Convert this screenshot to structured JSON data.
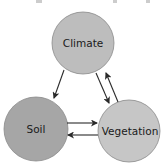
{
  "diagram": {
    "type": "cycle",
    "nodes": [
      {
        "id": "climate",
        "label": "Climate",
        "cx": 83,
        "cy": 43,
        "r": 31,
        "fill": "#bdbdbd"
      },
      {
        "id": "soil",
        "label": "Soil",
        "cx": 36,
        "cy": 129,
        "r": 32,
        "fill": "#a6a6a6"
      },
      {
        "id": "vegetation",
        "label": "Vegetation",
        "cx": 129,
        "cy": 131,
        "r": 31,
        "fill": "#c6c6c6"
      }
    ],
    "edges": [
      {
        "from": "climate",
        "to": "soil"
      },
      {
        "from": "climate",
        "to": "vegetation"
      },
      {
        "from": "vegetation",
        "to": "climate"
      },
      {
        "from": "soil",
        "to": "vegetation"
      },
      {
        "from": "vegetation",
        "to": "soil"
      }
    ],
    "colors": {
      "stroke": "#8a8a8a",
      "arrow": "#2a2a2a",
      "background": "#ffffff"
    }
  }
}
